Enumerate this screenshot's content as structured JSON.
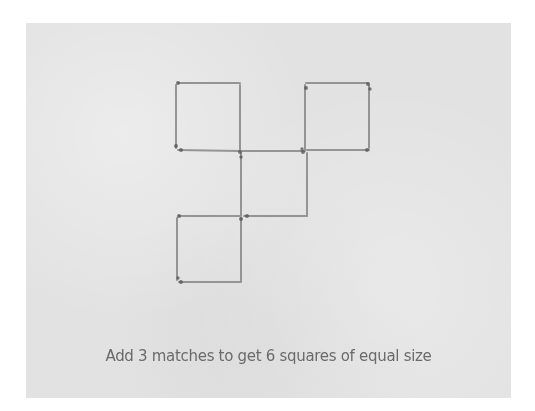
{
  "puzzle": {
    "caption": "Add 3 matches to get 6 squares of equal size",
    "colors": {
      "background": "#e2e2e2",
      "match_stick": "#8c8c8c",
      "match_head": "#555555",
      "caption_text": "#6a6a6a"
    },
    "squares": [
      {
        "name": "top-left",
        "x": 176,
        "y": 83,
        "size": 65
      },
      {
        "name": "top-right",
        "x": 305,
        "y": 83,
        "size": 65
      },
      {
        "name": "middle",
        "x": 241,
        "y": 151,
        "size": 65
      },
      {
        "name": "bottom-left",
        "x": 177,
        "y": 216,
        "size": 65
      }
    ],
    "match_count": 16
  }
}
